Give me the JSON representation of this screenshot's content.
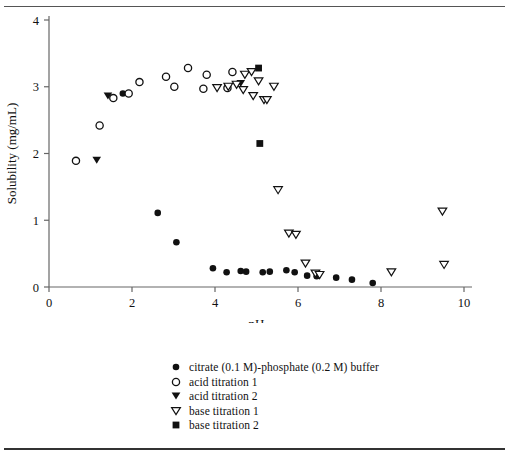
{
  "chart_data": {
    "type": "scatter",
    "title": "",
    "xlabel": "pH",
    "ylabel": "Solubility (mg/mL)",
    "xlim": [
      0,
      10
    ],
    "ylim": [
      0,
      4
    ],
    "xticks": [
      0,
      2,
      4,
      6,
      8,
      10
    ],
    "yticks": [
      0,
      1,
      2,
      3,
      4
    ],
    "grid": false,
    "legend_position": "below-plot",
    "series": [
      {
        "name": "citrate (0.1 M)-phosphate (0.2 M) buffer",
        "marker": "filled-circle",
        "points": [
          [
            1.78,
            2.9
          ],
          [
            2.62,
            1.11
          ],
          [
            3.07,
            0.67
          ],
          [
            3.95,
            0.28
          ],
          [
            4.28,
            0.22
          ],
          [
            4.62,
            0.24
          ],
          [
            4.75,
            0.23
          ],
          [
            5.15,
            0.22
          ],
          [
            5.32,
            0.23
          ],
          [
            5.72,
            0.25
          ],
          [
            5.92,
            0.22
          ],
          [
            6.22,
            0.17
          ],
          [
            6.45,
            0.16
          ],
          [
            6.92,
            0.14
          ],
          [
            7.3,
            0.11
          ],
          [
            7.8,
            0.06
          ]
        ]
      },
      {
        "name": "acid titration 1",
        "marker": "open-circle",
        "points": [
          [
            0.65,
            1.89
          ],
          [
            1.22,
            2.42
          ],
          [
            1.55,
            2.83
          ],
          [
            1.92,
            2.9
          ],
          [
            2.18,
            3.07
          ],
          [
            2.82,
            3.15
          ],
          [
            3.02,
            3.0
          ],
          [
            3.35,
            3.28
          ],
          [
            3.8,
            3.18
          ],
          [
            3.72,
            2.97
          ],
          [
            4.42,
            3.22
          ],
          [
            4.3,
            2.98
          ]
        ]
      },
      {
        "name": "acid titration 2",
        "marker": "filled-triangle-down",
        "points": [
          [
            1.15,
            1.9
          ],
          [
            1.42,
            2.86
          ],
          [
            4.62,
            3.05
          ]
        ]
      },
      {
        "name": "base titration 1",
        "marker": "open-triangle-down",
        "points": [
          [
            4.05,
            2.98
          ],
          [
            4.32,
            3.0
          ],
          [
            4.52,
            3.03
          ],
          [
            4.72,
            3.18
          ],
          [
            4.68,
            2.95
          ],
          [
            4.88,
            3.22
          ],
          [
            4.92,
            2.86
          ],
          [
            5.05,
            3.08
          ],
          [
            5.18,
            2.8
          ],
          [
            5.25,
            2.8
          ],
          [
            5.42,
            3.0
          ],
          [
            5.52,
            1.45
          ],
          [
            5.78,
            0.8
          ],
          [
            5.95,
            0.78
          ],
          [
            6.18,
            0.35
          ],
          [
            6.42,
            0.2
          ],
          [
            6.52,
            0.18
          ],
          [
            8.25,
            0.22
          ],
          [
            9.48,
            1.13
          ],
          [
            9.52,
            0.33
          ]
        ]
      },
      {
        "name": "base titration 2",
        "marker": "filled-square",
        "points": [
          [
            5.05,
            3.28
          ],
          [
            5.08,
            2.15
          ]
        ]
      }
    ]
  },
  "legend": {
    "items": [
      {
        "marker": "filled-circle",
        "label": "citrate (0.1 M)-phosphate (0.2 M) buffer"
      },
      {
        "marker": "open-circle",
        "label": "acid titration 1"
      },
      {
        "marker": "filled-triangle-down",
        "label": "acid titration 2"
      },
      {
        "marker": "open-triangle-down",
        "label": "base titration 1"
      },
      {
        "marker": "filled-square",
        "label": "base titration 2"
      }
    ]
  },
  "colors": {
    "ink": "#111111",
    "axis": "#666666",
    "rule": "#555555"
  }
}
